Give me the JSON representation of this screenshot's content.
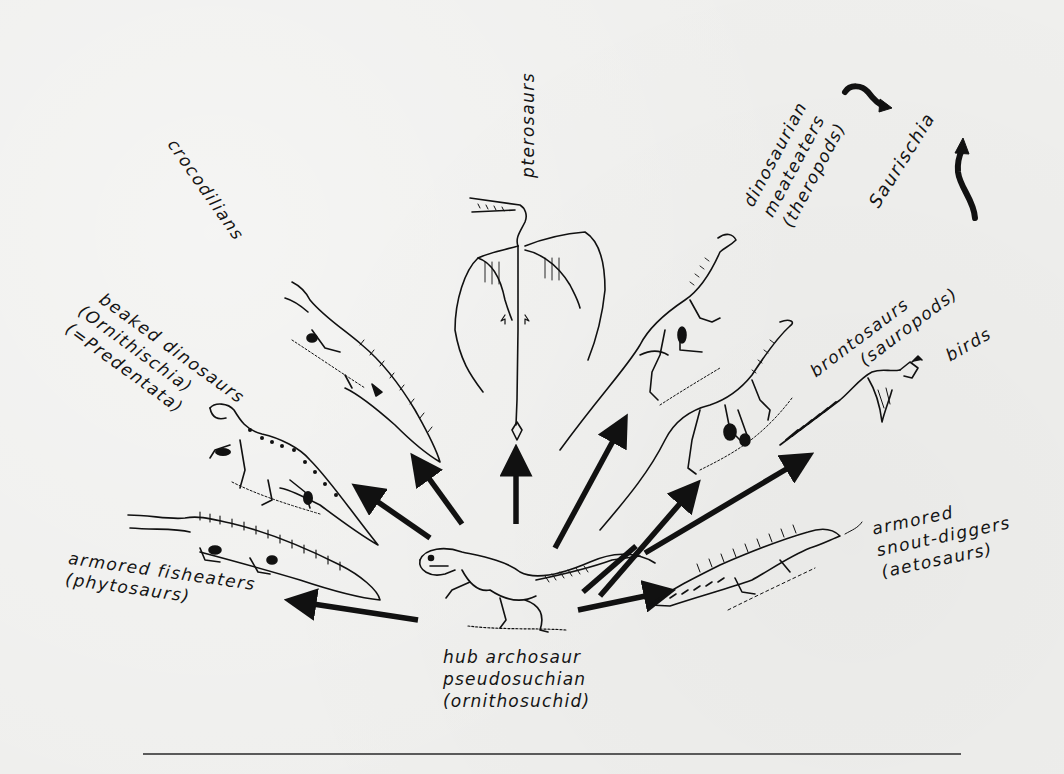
{
  "diagram": {
    "type": "adaptive-radiation",
    "hub": {
      "lines": [
        "hub archosaur",
        "pseudosuchian",
        "(ornithosuchid)"
      ]
    },
    "groups": [
      {
        "id": "phytosaurs",
        "lines": [
          "armored fisheaters",
          "(phytosaurs)"
        ]
      },
      {
        "id": "ornithischia",
        "lines": [
          "beaked dinosaurs",
          "(Ornithischia)",
          "(=Predentata)"
        ]
      },
      {
        "id": "crocodilians",
        "lines": [
          "crocodilians"
        ]
      },
      {
        "id": "pterosaurs",
        "lines": [
          "pterosaurs"
        ]
      },
      {
        "id": "theropods",
        "lines": [
          "dinosaurian",
          "meateaters",
          "(theropods)"
        ]
      },
      {
        "id": "sauropods",
        "lines": [
          "brontosaurs",
          "(sauropods)"
        ]
      },
      {
        "id": "birds",
        "lines": [
          "birds"
        ]
      },
      {
        "id": "aetosaurs",
        "lines": [
          "armored",
          "snout-diggers",
          "(aetosaurs)"
        ]
      }
    ],
    "clade_label": "Saurischia",
    "colors": {
      "ink": "#111111",
      "paper": "#efefed",
      "rule": "#5a5a5a"
    }
  }
}
